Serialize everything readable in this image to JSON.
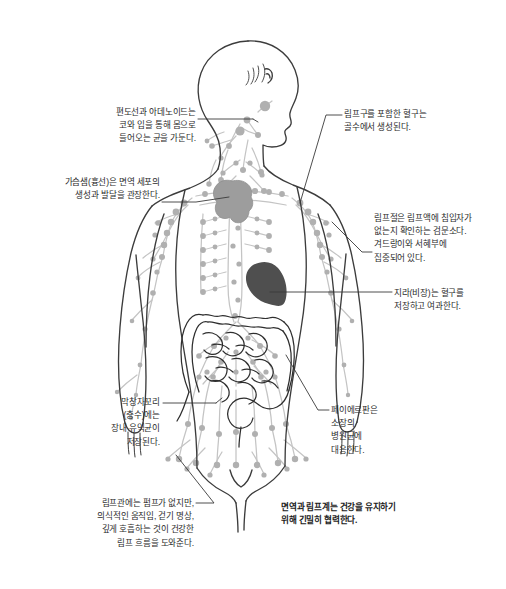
{
  "diagram": {
    "view": "측면을 향한 머리와 정면 몸통의 인체 외곽선",
    "colors": {
      "background": "#ffffff",
      "body_outline": "#3c3c3c",
      "lymph_vessels": "#bfbfbf",
      "lymph_nodes": "#b3b3b3",
      "thymus_fill": "#9d9d9d",
      "spleen_fill": "#4f4f4f",
      "intestine_outline": "#2e2e2e",
      "leader_line": "#3a3a3a",
      "text": "#2b2b2b"
    }
  },
  "callouts": {
    "tonsil": {
      "id": "tonsils-adenoids",
      "organ": "편도선과 아데노이드",
      "text": "편도선과 아데노이드는\n코와 입을 통해 몸으로\n들어오는 균을 가둔다.",
      "side": "left",
      "align": "right"
    },
    "thymus": {
      "id": "thymus",
      "organ": "가슴샘(흉선)",
      "text": "가슴샘(흉선)은 면역 세포의\n생성과 발달을 관장한다.",
      "side": "left",
      "align": "right"
    },
    "appendix": {
      "id": "appendix",
      "organ": "막창자꼬리(충수)",
      "text": "막창자꼬리\n(충수)에는\n장내 유익균이\n저장된다.",
      "side": "left",
      "align": "right"
    },
    "lymph_vessel": {
      "id": "lymph-vessels",
      "organ": "림프관",
      "text": "림프관에는 펌프가 없지만,\n의식적인 움직임, 걷기 명상,\n깊게 호흡하는 것이 건강한\n림프 흐름을 도와준다.",
      "side": "left",
      "align": "right"
    },
    "bone_marrow": {
      "id": "bone-marrow",
      "organ": "골수",
      "text": "림프구를 포함한 혈구는\n골수에서 생성된다.",
      "side": "right",
      "align": "left"
    },
    "lymph_node": {
      "id": "lymph-nodes",
      "organ": "림프절",
      "text": "림프절은 림프액에 침입자가\n없는지 확인하는 검문소다.\n겨드랑이와 서혜부에\n집중되어 있다.",
      "side": "right",
      "align": "left"
    },
    "spleen": {
      "id": "spleen",
      "organ": "지라(비장)",
      "text": "지라(비장)는 혈구를\n저장하고 여과한다.",
      "side": "right",
      "align": "left"
    },
    "peyers_patch": {
      "id": "peyers-patches",
      "organ": "페이에르판",
      "text": "페이에르판은\n소장의\n병원균에\n대응한다.",
      "side": "right",
      "align": "left"
    },
    "summary": {
      "id": "summary-note",
      "organ": "",
      "text": "면역과 림프계는 건강을 유지하기\n위해 긴밀히 협력한다.",
      "side": "bottom",
      "align": "left",
      "emphasis": "bold"
    }
  }
}
